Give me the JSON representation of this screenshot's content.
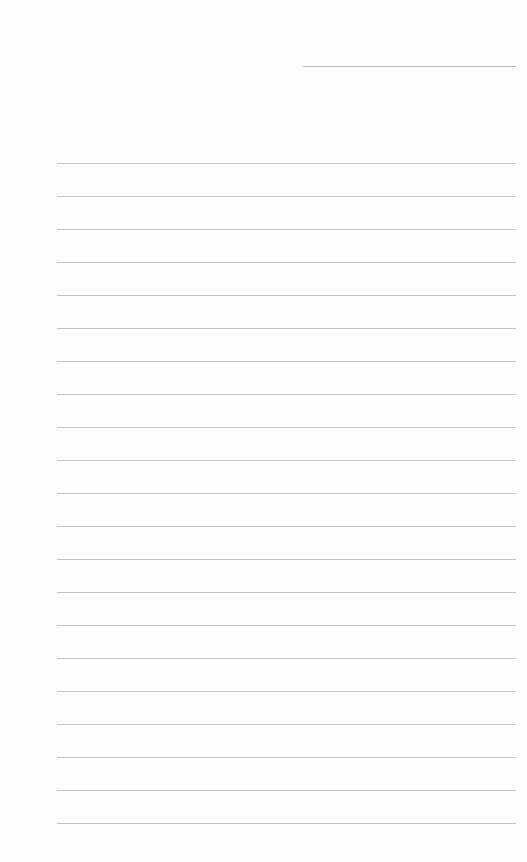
{
  "paper": {
    "type": "lined notebook paper",
    "background": "#fefefe",
    "line_color": "#c4c4c4",
    "date_line": {
      "x": 303,
      "y": 66,
      "width": 213
    },
    "rules": {
      "count": 21,
      "first_y": 163,
      "spacing": 33,
      "x": 57,
      "width": 459
    }
  }
}
